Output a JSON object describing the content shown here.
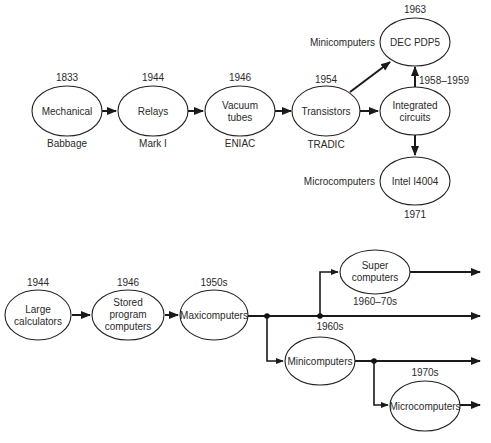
{
  "top_diagram": {
    "nodes": [
      {
        "id": "mechanical",
        "lines": [
          "Mechanical"
        ],
        "above": "1833",
        "below": "Babbage"
      },
      {
        "id": "relays",
        "lines": [
          "Relays"
        ],
        "above": "1944",
        "below": "Mark I"
      },
      {
        "id": "vacuum",
        "lines": [
          "Vacuum",
          "tubes"
        ],
        "above": "1946",
        "below": "ENIAC"
      },
      {
        "id": "transistors",
        "lines": [
          "Transistors"
        ],
        "above": "1954",
        "below": "TRADIC"
      },
      {
        "id": "ic",
        "lines": [
          "Integrated",
          "circuits"
        ]
      },
      {
        "id": "pdp5",
        "lines": [
          "DEC PDP5"
        ],
        "above": "1963",
        "side": "Minicomputers"
      },
      {
        "id": "i4004",
        "lines": [
          "Intel I4004"
        ],
        "below": "1971",
        "side": "Microcomputers"
      }
    ],
    "edge_labels": {
      "ic_to_pdp5": "1958–1959"
    }
  },
  "bottom_diagram": {
    "nodes": [
      {
        "id": "large",
        "lines": [
          "Large",
          "calculators"
        ],
        "above": "1944"
      },
      {
        "id": "stored",
        "lines": [
          "Stored",
          "program",
          "computers"
        ],
        "above": "1946"
      },
      {
        "id": "maxi",
        "lines": [
          "Maxicomputers"
        ],
        "above": "1950s"
      },
      {
        "id": "super",
        "lines": [
          "Super",
          "computers"
        ],
        "below": "1960–70s"
      },
      {
        "id": "mini",
        "lines": [
          "Minicomputers"
        ],
        "above": "1960s"
      },
      {
        "id": "micro",
        "lines": [
          "Microcomputers"
        ],
        "above": "1970s"
      }
    ]
  }
}
